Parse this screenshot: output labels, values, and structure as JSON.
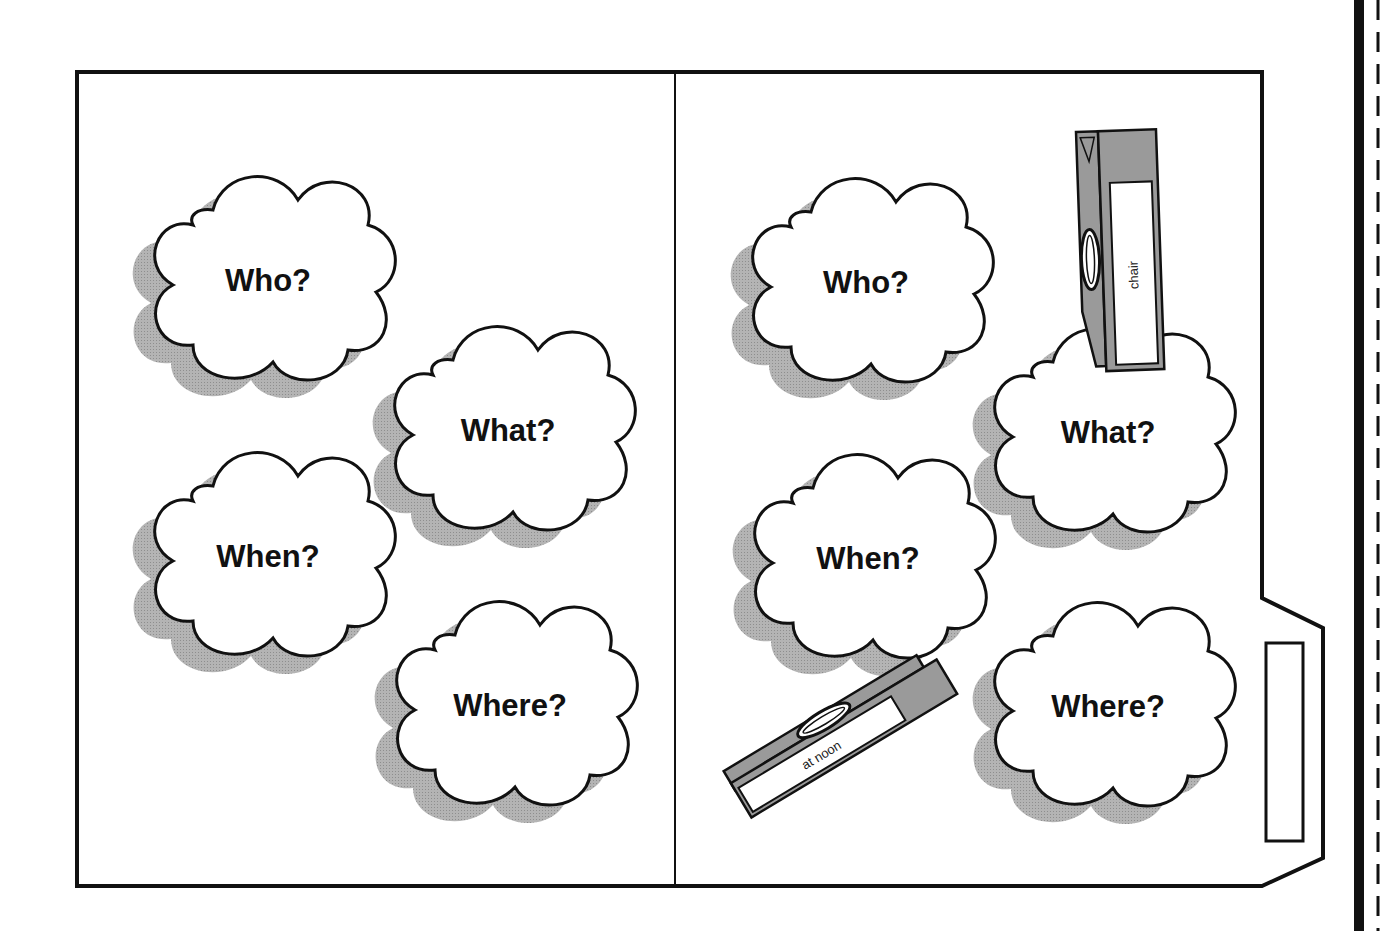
{
  "colors": {
    "outline": "#111111",
    "shadow": "#a9a9a9",
    "clothespin": "#9a9a9a",
    "paper": "#ffffff"
  },
  "left_panel": {
    "clouds": [
      {
        "label": "Who?"
      },
      {
        "label": "What?"
      },
      {
        "label": "When?"
      },
      {
        "label": "Where?"
      }
    ]
  },
  "right_panel": {
    "clouds": [
      {
        "label": "Who?"
      },
      {
        "label": "What?"
      },
      {
        "label": "When?"
      },
      {
        "label": "Where?"
      }
    ],
    "clothespins": [
      {
        "label": "chair",
        "attached_to": "What?"
      },
      {
        "label": "at noon",
        "attached_to": "When?"
      }
    ],
    "tab_label": ""
  }
}
